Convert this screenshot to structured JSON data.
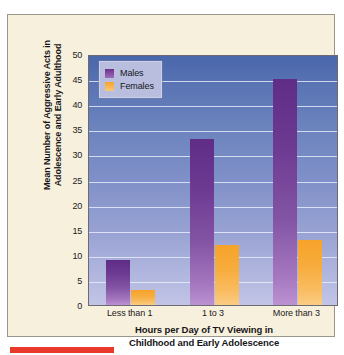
{
  "chart_data": {
    "type": "bar",
    "title": "",
    "xlabel": "Hours per Day of TV Viewing in Childhood and Early Adolescence",
    "xlabel_lines": [
      "Hours per Day of TV Viewing in",
      "Childhood and Early Adolescence"
    ],
    "ylabel": "Mean Number of Aggressive Acts in Adolescence and Early Adulthood",
    "ylabel_lines": [
      "Mean Number of Aggressive Acts in",
      "Adolescence and Early Adulthood"
    ],
    "categories": [
      "Less than 1",
      "1 to 3",
      "More than 3"
    ],
    "series": [
      {
        "name": "Males",
        "color": "#6a318d",
        "values": [
          9,
          33,
          45
        ]
      },
      {
        "name": "Females",
        "color": "#f6a32a",
        "values": [
          3,
          12,
          13
        ]
      }
    ],
    "ylim": [
      0,
      50
    ],
    "yticks": [
      0,
      5,
      10,
      15,
      20,
      25,
      30,
      35,
      40,
      45,
      50
    ],
    "grid": true,
    "legend_position": "top-left",
    "legend_entries": [
      "Males",
      "Females"
    ]
  },
  "figure": {
    "background_color": "#f7f0dc",
    "plot_background_top": "#4a67ab",
    "plot_background_bottom": "#c2c5e6",
    "marker_color": "#e8392a"
  }
}
